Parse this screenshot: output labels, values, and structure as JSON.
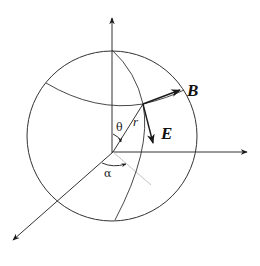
{
  "diagram": {
    "colors": {
      "line": "#333333",
      "vector": "#1a1a1a",
      "projection": "#c4c4c4",
      "background": "#ffffff"
    },
    "labels": {
      "B": "B",
      "E": "E",
      "r": "r",
      "theta": "θ",
      "alpha": "α"
    },
    "elements": {
      "sphere": "sphere-outline",
      "axes": [
        "z-axis (vertical up)",
        "y-axis (horizontal right)",
        "x-axis (diagonal down-left)"
      ],
      "curves": [
        "latitude arc",
        "meridian arc"
      ],
      "vectors": [
        "B (tangent along latitude)",
        "E (tangent along meridian)",
        "r (radius)"
      ],
      "angles": [
        "θ (polar angle from z-axis)",
        "α (azimuthal angle)"
      ]
    }
  }
}
